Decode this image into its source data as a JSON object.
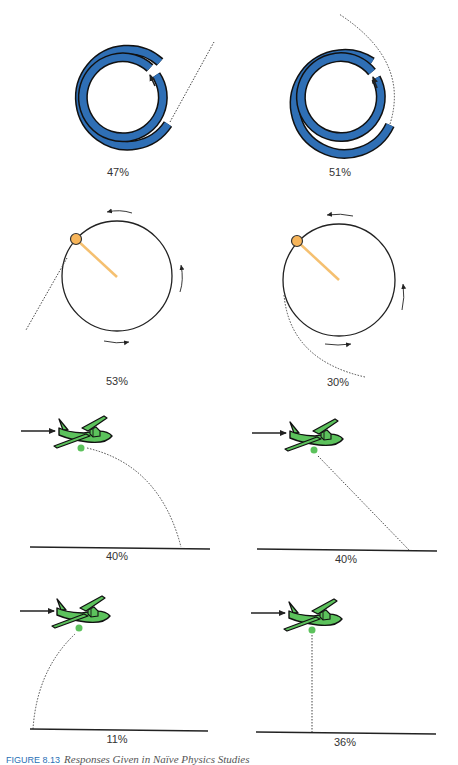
{
  "figure": {
    "caption_label": "FIGURE 8.13",
    "caption_title": "Responses Given in Naïve Physics Studies",
    "colors": {
      "tube_blue": "#2f6fb5",
      "ball_orange": "#f7b55a",
      "string_orange": "#f5c070",
      "plane_green": "#5cc25c",
      "stroke": "#222222",
      "caption_blue": "#2a6fb5"
    }
  },
  "panels": [
    {
      "id": "spiral-tube-straight",
      "type": "spiral-tube",
      "trajectory": "straight",
      "percent": "47%"
    },
    {
      "id": "spiral-tube-curved",
      "type": "spiral-tube",
      "trajectory": "curved",
      "percent": "51%"
    },
    {
      "id": "ball-string-tangent",
      "type": "ball-on-string",
      "trajectory": "straight tangent",
      "percent": "53%"
    },
    {
      "id": "ball-string-curved",
      "type": "ball-on-string",
      "trajectory": "curved",
      "percent": "30%"
    },
    {
      "id": "plane-drop-forward-arc",
      "type": "plane-drop",
      "trajectory": "forward parabola",
      "percent": "40%"
    },
    {
      "id": "plane-drop-diagonal",
      "type": "plane-drop",
      "trajectory": "straight diagonal",
      "percent": "40%"
    },
    {
      "id": "plane-drop-backward",
      "type": "plane-drop",
      "trajectory": "backward arc",
      "percent": "11%"
    },
    {
      "id": "plane-drop-vertical",
      "type": "plane-drop",
      "trajectory": "straight down",
      "percent": "36%"
    }
  ]
}
